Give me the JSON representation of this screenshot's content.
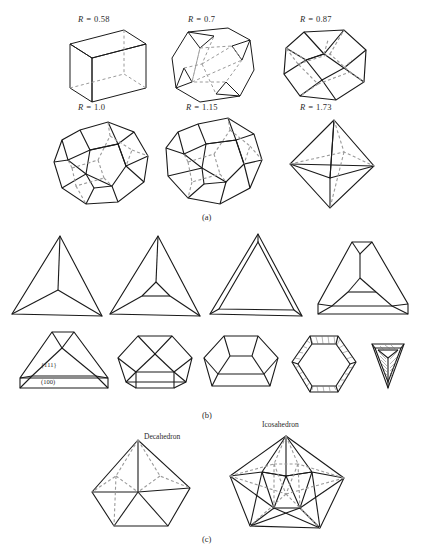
{
  "figure": {
    "panels": [
      {
        "id": "a",
        "label": "(a)"
      },
      {
        "id": "b",
        "label": "(b)"
      },
      {
        "id": "c",
        "label": "(c)"
      }
    ]
  },
  "panel_a": {
    "label": "(a)",
    "shapes": [
      {
        "name": "cube",
        "ratio_label": "R = 0.58",
        "r_prefix": "R = ",
        "r_value": "0.58"
      },
      {
        "name": "truncated-cube",
        "ratio_label": "R = 0.7",
        "r_prefix": "R = ",
        "r_value": "0.7"
      },
      {
        "name": "cuboctahedron",
        "ratio_label": "R = 0.87",
        "r_prefix": "R = ",
        "r_value": "0.87"
      },
      {
        "name": "truncated-octahedron",
        "ratio_label": "R = 1.0",
        "r_prefix": "R = ",
        "r_value": "1.0"
      },
      {
        "name": "truncated-octahedron-2",
        "ratio_label": "R = 1.15",
        "r_prefix": "R = ",
        "r_value": "1.15"
      },
      {
        "name": "octahedron",
        "ratio_label": "R = 1.73",
        "r_prefix": "R = ",
        "r_value": "1.73"
      }
    ]
  },
  "panel_b": {
    "label": "(b)",
    "face_labels": {
      "octahedral": "{111}",
      "cubic": "(100)"
    },
    "shapes": [
      {
        "name": "tetrahedron"
      },
      {
        "name": "slightly-truncated-tetrahedron"
      },
      {
        "name": "tetrahedron-front-face"
      },
      {
        "name": "truncated-tetrahedron"
      },
      {
        "name": "truncated-tetrahedron-labeled"
      },
      {
        "name": "more-truncated-tetrahedron"
      },
      {
        "name": "pentagonal-truncated-form"
      },
      {
        "name": "hexagonal-plate"
      },
      {
        "name": "small-hatched-tetrahedron"
      }
    ]
  },
  "panel_c": {
    "label": "(c)",
    "shapes": [
      {
        "name": "decahedron",
        "title": "Decahedron"
      },
      {
        "name": "icosahedron",
        "title": "Icosahedron"
      }
    ]
  },
  "style": {
    "solid_stroke": "#1a1a1a",
    "hidden_stroke": "#9a9a9a",
    "background": "#ffffff"
  }
}
